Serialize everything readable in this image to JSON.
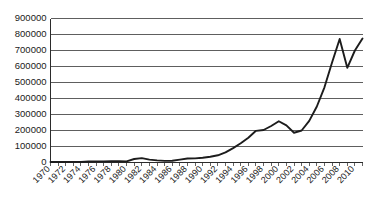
{
  "chart_data": {
    "type": "line",
    "title": "",
    "subtitle": "",
    "xlabel": "",
    "ylabel": "",
    "grid": "horizontal",
    "legend": "none",
    "xlim": [
      1970,
      2011
    ],
    "ylim": [
      0,
      900000
    ],
    "ytick_labels": [
      "900000",
      "800000",
      "700000",
      "600000",
      "500000",
      "400000",
      "300000",
      "200000",
      "100000",
      "0"
    ],
    "ytick_values": [
      900000,
      800000,
      700000,
      600000,
      500000,
      400000,
      300000,
      200000,
      100000,
      0
    ],
    "xtick_labels": [
      "1970",
      "1972",
      "1974",
      "1976",
      "1978",
      "1980",
      "1982",
      "1984",
      "1986",
      "1988",
      "1990",
      "1992",
      "1994",
      "1996",
      "1998",
      "2000",
      "2002",
      "2004",
      "2006",
      "2008",
      "2010"
    ],
    "xtick_values": [
      1970,
      1972,
      1974,
      1976,
      1978,
      1980,
      1982,
      1984,
      1986,
      1988,
      1990,
      1992,
      1994,
      1996,
      1998,
      2000,
      2002,
      2004,
      2006,
      2008,
      2010
    ],
    "series": [
      {
        "name": "series-1",
        "color": "#1c1c1c",
        "x": [
          1970,
          1971,
          1972,
          1973,
          1974,
          1975,
          1976,
          1977,
          1978,
          1979,
          1980,
          1981,
          1982,
          1983,
          1984,
          1985,
          1986,
          1987,
          1988,
          1989,
          1990,
          1991,
          1992,
          1993,
          1994,
          1995,
          1996,
          1997,
          1998,
          1999,
          2000,
          2001,
          2002,
          2003,
          2004,
          2005,
          2006,
          2007,
          2008,
          2009,
          2010,
          2011
        ],
        "values": [
          3000,
          3000,
          3500,
          4000,
          4000,
          6000,
          7000,
          7000,
          8000,
          8000,
          7000,
          22000,
          27000,
          18000,
          13000,
          10000,
          11000,
          18000,
          25000,
          26000,
          30000,
          36000,
          45000,
          63000,
          90000,
          120000,
          155000,
          198000,
          203000,
          228000,
          258000,
          232000,
          186000,
          200000,
          260000,
          350000,
          470000,
          625000,
          772000,
          592000,
          700000,
          775000
        ]
      }
    ]
  }
}
